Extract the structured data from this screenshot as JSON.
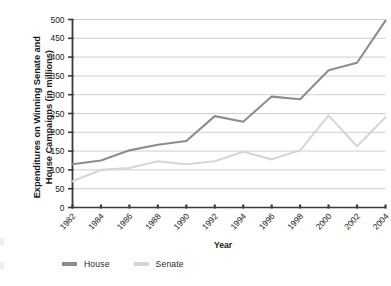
{
  "chart_data": {
    "type": "line",
    "title": "",
    "xlabel": "Year",
    "ylabel": "Expenditures on Winning Senate and House Campaigns (in millions)",
    "categories": [
      "1982",
      "1984",
      "1986",
      "1988",
      "1990",
      "1992",
      "1994",
      "1996",
      "1998",
      "2000",
      "2002",
      "2004"
    ],
    "x": [
      1982,
      1984,
      1986,
      1988,
      1990,
      1992,
      1994,
      1996,
      1998,
      2000,
      2002,
      2004
    ],
    "series": [
      {
        "name": "House",
        "color": "#8d8d8d",
        "values": [
          115,
          125,
          152,
          167,
          177,
          243,
          228,
          295,
          288,
          365,
          385,
          497
        ]
      },
      {
        "name": "Senate",
        "color": "#d6d6d6",
        "values": [
          70,
          100,
          105,
          123,
          115,
          123,
          148,
          128,
          152,
          245,
          163,
          240
        ]
      }
    ],
    "ylim": [
      0,
      500
    ],
    "yticks": [
      0,
      50,
      100,
      150,
      200,
      250,
      300,
      350,
      400,
      450,
      500
    ],
    "ytick_labels": [
      "0",
      "50",
      "100",
      "150",
      "200",
      "250",
      "300",
      "350",
      "400",
      "450",
      "500"
    ],
    "grid": true,
    "grid_axis": "y",
    "grid_color": "#c9c9c9",
    "legend_position": "bottom-left",
    "axis_color": "#3b3b3b",
    "background": "#ffffff"
  },
  "axis_titles": {
    "y": "Expenditures on Winning Senate and House Campaigns (in millions)",
    "x": "Year"
  },
  "legend": {
    "items": [
      {
        "label": "House",
        "color": "#8d8d8d"
      },
      {
        "label": "Senate",
        "color": "#d6d6d6"
      }
    ]
  }
}
